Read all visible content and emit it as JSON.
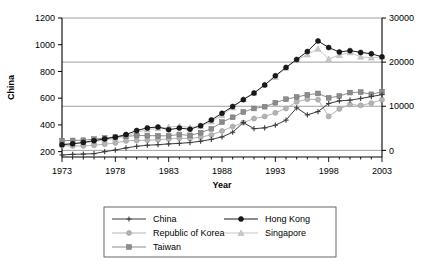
{
  "chart_data": {
    "type": "line",
    "title": "",
    "xlabel": "Year",
    "ylabel": "China",
    "ylabel_right": "",
    "grid": true,
    "legend_position": "bottom",
    "x": [
      1973,
      1974,
      1975,
      1976,
      1977,
      1978,
      1979,
      1980,
      1981,
      1982,
      1983,
      1984,
      1985,
      1986,
      1987,
      1988,
      1989,
      1990,
      1991,
      1992,
      1993,
      1994,
      1995,
      1996,
      1997,
      1998,
      1999,
      2000,
      2001,
      2002,
      2003
    ],
    "xticks": [
      1973,
      1978,
      1983,
      1988,
      1993,
      1998,
      2003
    ],
    "xlim": [
      1973,
      2003
    ],
    "yticks_left": [
      200,
      400,
      600,
      800,
      1000,
      1200
    ],
    "ylim_left": [
      160,
      1200
    ],
    "yticks_right": [
      0,
      10000,
      20000,
      30000
    ],
    "ylim_right": [
      -1500,
      30000
    ],
    "series": [
      {
        "name": "China",
        "axis": "left",
        "marker": "plus",
        "color": "#3b3b3b",
        "values": [
          175,
          180,
          182,
          185,
          200,
          212,
          228,
          240,
          248,
          252,
          258,
          262,
          268,
          278,
          292,
          310,
          345,
          418,
          372,
          378,
          398,
          436,
          528,
          475,
          500,
          560,
          580,
          585,
          598,
          612,
          627
        ]
      },
      {
        "name": "Hong Kong",
        "axis": "right",
        "marker": "circle-filled",
        "color": "#1a1a1a",
        "values": [
          1300,
          1500,
          1800,
          2200,
          2600,
          3000,
          3600,
          4500,
          5100,
          5300,
          4700,
          5050,
          4800,
          5600,
          6900,
          8400,
          9950,
          11500,
          13000,
          14800,
          16900,
          18800,
          20600,
          22400,
          24800,
          23300,
          22300,
          22600,
          22200,
          21900,
          21200
        ]
      },
      {
        "name": "Republic of Korea",
        "axis": "right",
        "marker": "circle-light",
        "color": "#b4b4b4",
        "values": [
          1050,
          1000,
          1000,
          1150,
          1400,
          1700,
          2150,
          2250,
          2300,
          2400,
          2600,
          2750,
          2700,
          3000,
          3500,
          4400,
          5400,
          6300,
          7200,
          7700,
          8500,
          9500,
          11000,
          11600,
          11500,
          7700,
          9400,
          10400,
          10200,
          10700,
          11500
        ]
      },
      {
        "name": "Singapore",
        "axis": "right",
        "marker": "triangle",
        "color": "#c8c8c8",
        "values": [
          1400,
          1500,
          1700,
          2000,
          2350,
          2700,
          3200,
          4100,
          4700,
          5000,
          5300,
          5500,
          5200,
          5500,
          6500,
          8000,
          9700,
          11600,
          13000,
          14900,
          16600,
          18700,
          20500,
          21700,
          23000,
          20700,
          21600,
          22200,
          21200,
          21000,
          21200
        ]
      },
      {
        "name": "Taiwan",
        "axis": "right",
        "marker": "square",
        "color": "#8c8c8c",
        "values": [
          2200,
          2250,
          2300,
          2550,
          2800,
          3050,
          3200,
          3350,
          3350,
          3300,
          3300,
          3600,
          3400,
          4000,
          4900,
          6400,
          7500,
          8700,
          9500,
          9900,
          10800,
          11600,
          12100,
          12600,
          12900,
          11900,
          12300,
          13100,
          13200,
          12700,
          13300
        ]
      }
    ]
  },
  "axes": {
    "left_title": "China",
    "bottom_title": "Year",
    "left_ticks": [
      "200",
      "400",
      "600",
      "800",
      "1000",
      "1200"
    ],
    "right_ticks": [
      "0",
      "10000",
      "20000",
      "30000"
    ],
    "bottom_ticks": [
      "1973",
      "1978",
      "1983",
      "1988",
      "1993",
      "1998",
      "2003"
    ]
  },
  "legend": {
    "entries": [
      {
        "label": "China",
        "marker": "plus",
        "color": "#3b3b3b"
      },
      {
        "label": "Hong Kong",
        "marker": "circle-filled",
        "color": "#1a1a1a"
      },
      {
        "label": "Republic of Korea",
        "marker": "circle-light",
        "color": "#b4b4b4"
      },
      {
        "label": "Singapore",
        "marker": "triangle",
        "color": "#c8c8c8"
      },
      {
        "label": "Taiwan",
        "marker": "square",
        "color": "#8c8c8c"
      }
    ]
  },
  "style": {
    "axis_color": "#000000",
    "grid_color": "#888888",
    "background": "#ffffff"
  }
}
